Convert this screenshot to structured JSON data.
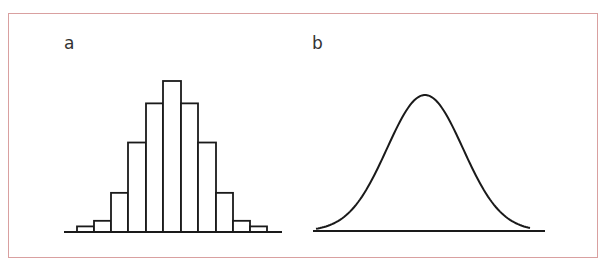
{
  "panels": {
    "a": {
      "label": "a",
      "description": "Histogram of a symmetric bell-shaped distribution"
    },
    "b": {
      "label": "b",
      "description": "Smooth normal distribution curve"
    }
  },
  "colors": {
    "border": "#d9a0a0",
    "line": "#1a1a1a"
  },
  "chart_data": [
    {
      "type": "bar",
      "title": "a",
      "categories": [
        "1",
        "2",
        "3",
        "4",
        "5",
        "6",
        "7",
        "8",
        "9",
        "10",
        "11"
      ],
      "values": [
        1,
        2,
        7,
        16,
        23,
        27,
        23,
        16,
        7,
        2,
        1
      ],
      "xlabel": "",
      "ylabel": "",
      "grid": false
    },
    {
      "type": "line",
      "title": "b",
      "description": "normal (Gaussian) density curve",
      "grid": false
    }
  ]
}
